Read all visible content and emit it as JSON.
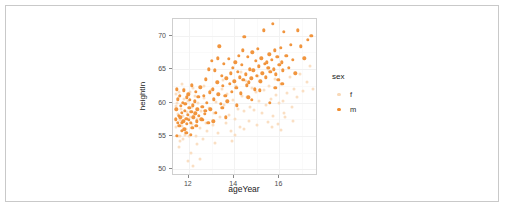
{
  "chart_data": {
    "type": "scatter",
    "title": "",
    "xlabel": "ageYear",
    "ylabel": "heightIn",
    "xlim": [
      11.3,
      17.7
    ],
    "ylim": [
      49.0,
      72.5
    ],
    "xticks": [
      12,
      14,
      16
    ],
    "yticks": [
      50,
      55,
      60,
      65,
      70
    ],
    "grid": true,
    "legend": {
      "title": "sex",
      "position": "right",
      "entries": [
        {
          "label": "f",
          "color": "#F9D9B8"
        },
        {
          "label": "m",
          "color": "#F08C2E"
        }
      ]
    },
    "series": [
      {
        "name": "f",
        "color": "#F9D9B8",
        "points": [
          [
            11.42,
            59.5
          ],
          [
            11.42,
            61.2
          ],
          [
            11.45,
            56.3
          ],
          [
            11.48,
            60.0
          ],
          [
            11.5,
            55.0
          ],
          [
            11.52,
            58.3
          ],
          [
            11.55,
            53.3
          ],
          [
            11.58,
            61.5
          ],
          [
            11.6,
            57.4
          ],
          [
            11.62,
            55.0
          ],
          [
            11.65,
            59.0
          ],
          [
            11.68,
            56.5
          ],
          [
            11.7,
            62.8
          ],
          [
            11.72,
            58.0
          ],
          [
            11.75,
            54.6
          ],
          [
            11.78,
            60.5
          ],
          [
            11.8,
            57.2
          ],
          [
            11.83,
            55.2
          ],
          [
            11.85,
            59.8
          ],
          [
            11.88,
            56.0
          ],
          [
            11.92,
            58.6
          ],
          [
            11.95,
            51.3
          ],
          [
            11.98,
            60.2
          ],
          [
            12.0,
            55.0
          ],
          [
            12.05,
            57.8
          ],
          [
            12.08,
            52.5
          ],
          [
            12.12,
            59.3
          ],
          [
            12.15,
            56.8
          ],
          [
            12.18,
            50.5
          ],
          [
            12.22,
            58.1
          ],
          [
            12.28,
            61.0
          ],
          [
            12.32,
            55.0
          ],
          [
            12.38,
            57.5
          ],
          [
            12.42,
            59.9
          ],
          [
            12.48,
            56.2
          ],
          [
            12.55,
            58.8
          ],
          [
            12.62,
            54.5
          ],
          [
            12.68,
            60.7
          ],
          [
            12.75,
            57.0
          ],
          [
            12.82,
            55.8
          ],
          [
            12.9,
            59.2
          ],
          [
            12.98,
            61.8
          ],
          [
            13.05,
            56.6
          ],
          [
            13.12,
            58.4
          ],
          [
            13.2,
            60.1
          ],
          [
            13.3,
            55.4
          ],
          [
            13.38,
            57.9
          ],
          [
            13.45,
            62.0
          ],
          [
            13.55,
            59.6
          ],
          [
            13.62,
            56.9
          ],
          [
            13.7,
            61.3
          ],
          [
            13.78,
            58.2
          ],
          [
            13.85,
            55.7
          ],
          [
            13.95,
            60.4
          ],
          [
            14.02,
            57.6
          ],
          [
            14.1,
            62.5
          ],
          [
            14.18,
            59.1
          ],
          [
            14.25,
            56.4
          ],
          [
            14.35,
            61.0
          ],
          [
            14.42,
            58.7
          ],
          [
            14.5,
            63.2
          ],
          [
            14.58,
            60.8
          ],
          [
            14.65,
            57.3
          ],
          [
            14.72,
            59.4
          ],
          [
            14.8,
            62.1
          ],
          [
            14.88,
            58.9
          ],
          [
            14.95,
            61.6
          ],
          [
            15.02,
            56.7
          ],
          [
            15.1,
            60.3
          ],
          [
            15.18,
            63.0
          ],
          [
            15.25,
            58.5
          ],
          [
            15.32,
            61.9
          ],
          [
            15.4,
            59.7
          ],
          [
            15.48,
            57.1
          ],
          [
            15.55,
            62.4
          ],
          [
            15.62,
            60.6
          ],
          [
            15.7,
            58.0
          ],
          [
            15.78,
            63.5
          ],
          [
            15.85,
            61.1
          ],
          [
            15.92,
            56.8
          ],
          [
            16.0,
            59.9
          ],
          [
            16.08,
            62.7
          ],
          [
            16.15,
            60.2
          ],
          [
            16.25,
            57.8
          ],
          [
            16.35,
            61.4
          ],
          [
            16.45,
            63.8
          ],
          [
            16.55,
            59.3
          ],
          [
            16.65,
            62.0
          ],
          [
            16.78,
            60.9
          ],
          [
            16.9,
            64.2
          ],
          [
            17.05,
            61.7
          ],
          [
            17.2,
            63.1
          ],
          [
            17.35,
            65.4
          ],
          [
            17.5,
            62.0
          ],
          [
            11.55,
            60.8
          ],
          [
            11.62,
            54.2
          ],
          [
            11.78,
            62.0
          ],
          [
            12.05,
            61.5
          ],
          [
            12.35,
            53.8
          ],
          [
            12.65,
            62.4
          ],
          [
            13.15,
            54.0
          ],
          [
            13.5,
            63.4
          ],
          [
            14.05,
            55.1
          ],
          [
            14.45,
            56.0
          ],
          [
            15.05,
            64.0
          ],
          [
            15.65,
            56.3
          ],
          [
            16.2,
            58.4
          ],
          [
            16.6,
            57.2
          ],
          [
            12.5,
            51.5
          ],
          [
            12.2,
            62.2
          ],
          [
            13.9,
            54.2
          ],
          [
            14.3,
            64.6
          ],
          [
            15.5,
            65.0
          ],
          [
            16.05,
            55.9
          ]
        ]
      },
      {
        "name": "m",
        "color": "#F08C2E",
        "points": [
          [
            11.42,
            57.5
          ],
          [
            11.45,
            59.0
          ],
          [
            11.48,
            62.0
          ],
          [
            11.5,
            57.0
          ],
          [
            11.52,
            60.5
          ],
          [
            11.55,
            58.0
          ],
          [
            11.58,
            56.5
          ],
          [
            11.6,
            61.0
          ],
          [
            11.62,
            57.8
          ],
          [
            11.65,
            59.5
          ],
          [
            11.68,
            55.8
          ],
          [
            11.7,
            58.5
          ],
          [
            11.72,
            60.0
          ],
          [
            11.75,
            57.2
          ],
          [
            11.78,
            61.8
          ],
          [
            11.8,
            56.0
          ],
          [
            11.82,
            58.8
          ],
          [
            11.85,
            59.8
          ],
          [
            11.88,
            57.6
          ],
          [
            11.9,
            60.8
          ],
          [
            11.92,
            56.8
          ],
          [
            11.95,
            58.2
          ],
          [
            11.98,
            61.2
          ],
          [
            12.0,
            57.4
          ],
          [
            12.02,
            59.2
          ],
          [
            12.05,
            60.4
          ],
          [
            12.08,
            57.0
          ],
          [
            12.1,
            58.6
          ],
          [
            12.12,
            62.6
          ],
          [
            12.15,
            56.2
          ],
          [
            12.18,
            59.6
          ],
          [
            12.2,
            57.8
          ],
          [
            12.25,
            60.2
          ],
          [
            12.28,
            58.4
          ],
          [
            12.3,
            61.6
          ],
          [
            12.35,
            57.2
          ],
          [
            12.38,
            59.0
          ],
          [
            12.42,
            60.9
          ],
          [
            12.45,
            58.0
          ],
          [
            12.5,
            62.3
          ],
          [
            12.55,
            57.5
          ],
          [
            12.6,
            59.4
          ],
          [
            12.65,
            61.0
          ],
          [
            12.7,
            58.3
          ],
          [
            12.75,
            63.5
          ],
          [
            12.8,
            60.0
          ],
          [
            12.85,
            57.0
          ],
          [
            12.88,
            65.0
          ],
          [
            12.92,
            61.5
          ],
          [
            12.95,
            59.0
          ],
          [
            13.0,
            66.2
          ],
          [
            13.05,
            62.0
          ],
          [
            13.1,
            60.5
          ],
          [
            13.15,
            64.8
          ],
          [
            13.2,
            58.5
          ],
          [
            13.25,
            63.0
          ],
          [
            13.3,
            61.2
          ],
          [
            13.35,
            68.4
          ],
          [
            13.4,
            59.8
          ],
          [
            13.45,
            64.0
          ],
          [
            13.5,
            62.5
          ],
          [
            13.55,
            65.8
          ],
          [
            13.6,
            61.0
          ],
          [
            13.65,
            63.6
          ],
          [
            13.7,
            60.2
          ],
          [
            13.75,
            66.5
          ],
          [
            13.8,
            62.8
          ],
          [
            13.85,
            64.4
          ],
          [
            13.9,
            61.6
          ],
          [
            13.95,
            65.2
          ],
          [
            14.0,
            63.2
          ],
          [
            14.05,
            66.0
          ],
          [
            14.1,
            62.2
          ],
          [
            14.15,
            64.6
          ],
          [
            14.2,
            67.0
          ],
          [
            14.25,
            63.8
          ],
          [
            14.3,
            61.4
          ],
          [
            14.35,
            65.6
          ],
          [
            14.4,
            63.4
          ],
          [
            14.45,
            69.8
          ],
          [
            14.5,
            64.2
          ],
          [
            14.55,
            62.6
          ],
          [
            14.6,
            66.8
          ],
          [
            14.65,
            63.0
          ],
          [
            14.7,
            65.0
          ],
          [
            14.75,
            63.6
          ],
          [
            14.8,
            67.5
          ],
          [
            14.85,
            64.8
          ],
          [
            14.9,
            62.0
          ],
          [
            14.95,
            66.2
          ],
          [
            15.0,
            64.0
          ],
          [
            15.05,
            68.0
          ],
          [
            15.1,
            65.4
          ],
          [
            15.15,
            63.2
          ],
          [
            15.2,
            66.6
          ],
          [
            15.25,
            64.4
          ],
          [
            15.3,
            70.8
          ],
          [
            15.35,
            65.8
          ],
          [
            15.4,
            63.8
          ],
          [
            15.45,
            66.0
          ],
          [
            15.5,
            65.2
          ],
          [
            15.55,
            67.2
          ],
          [
            15.6,
            64.6
          ],
          [
            15.65,
            66.4
          ],
          [
            15.7,
            71.8
          ],
          [
            15.75,
            65.0
          ],
          [
            15.8,
            67.8
          ],
          [
            15.85,
            64.2
          ],
          [
            15.9,
            66.8
          ],
          [
            15.95,
            63.4
          ],
          [
            16.0,
            65.6
          ],
          [
            16.05,
            68.2
          ],
          [
            16.1,
            66.0
          ],
          [
            16.15,
            64.8
          ],
          [
            16.2,
            70.6
          ],
          [
            16.3,
            67.0
          ],
          [
            16.4,
            65.2
          ],
          [
            16.5,
            68.6
          ],
          [
            16.6,
            66.4
          ],
          [
            16.7,
            64.4
          ],
          [
            16.8,
            70.8
          ],
          [
            16.95,
            68.4
          ],
          [
            17.1,
            66.6
          ],
          [
            17.25,
            69.4
          ],
          [
            17.4,
            70.0
          ],
          [
            12.62,
            57.4
          ],
          [
            12.72,
            58.8
          ],
          [
            13.08,
            57.2
          ],
          [
            13.28,
            66.6
          ],
          [
            13.48,
            59.2
          ],
          [
            14.12,
            59.6
          ],
          [
            14.38,
            67.8
          ],
          [
            14.62,
            60.8
          ],
          [
            15.12,
            61.8
          ],
          [
            15.58,
            60.0
          ],
          [
            11.48,
            55.0
          ],
          [
            11.68,
            57.0
          ],
          [
            11.88,
            55.5
          ],
          [
            12.08,
            55.2
          ],
          [
            12.32,
            56.5
          ],
          [
            13.62,
            57.8
          ],
          [
            14.78,
            60.4
          ],
          [
            15.82,
            62.2
          ],
          [
            16.12,
            62.8
          ]
        ]
      }
    ]
  }
}
